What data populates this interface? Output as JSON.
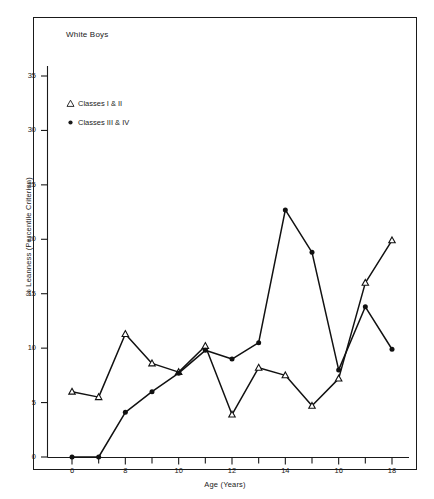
{
  "figure": {
    "title": "White Boys",
    "xlabel": "Age (Years)",
    "ylabel": "% Leanness (Percentile Criterion)"
  },
  "legend": [
    {
      "symbol": "open-triangle",
      "label": "Classes I & II"
    },
    {
      "symbol": "filled-circle",
      "label": "Classes III & IV"
    }
  ],
  "axis": {
    "y_ticks": [
      "0",
      "5",
      "10",
      "15",
      "20",
      "25",
      "30",
      "35"
    ],
    "x_ticks": [
      "6",
      "8",
      "10",
      "12",
      "14",
      "16",
      "18"
    ]
  },
  "chart_data": {
    "type": "line",
    "title": "White Boys",
    "xlabel": "Age (Years)",
    "ylabel": "% Leanness (Percentile Criterion)",
    "xlim": [
      5.4,
      18.7
    ],
    "ylim": [
      0,
      37.5
    ],
    "x_tick_values": [
      6,
      7,
      8,
      9,
      10,
      11,
      12,
      13,
      14,
      15,
      16,
      17,
      18
    ],
    "x_tick_labeled": [
      6,
      8,
      10,
      12,
      14,
      16,
      18
    ],
    "y_tick_values": [
      0,
      5,
      10,
      15,
      20,
      25,
      30,
      35
    ],
    "grid": false,
    "legend_position": "upper-left-inside",
    "x": [
      6,
      7,
      8,
      9,
      10,
      11,
      12,
      13,
      14,
      15,
      16,
      17,
      18
    ],
    "series": [
      {
        "name": "Classes I & II",
        "marker": "open-triangle",
        "x": [
          6,
          7,
          8,
          9,
          10,
          11,
          12,
          13,
          14,
          15,
          16,
          17,
          18
        ],
        "values": [
          6.0,
          5.5,
          11.3,
          8.6,
          7.8,
          10.2,
          3.9,
          8.2,
          7.5,
          4.7,
          7.2,
          16.0,
          19.9
        ]
      },
      {
        "name": "Classes III & IV",
        "marker": "filled-circle",
        "x": [
          6,
          7,
          8,
          9,
          10,
          11,
          12,
          13,
          14,
          15,
          16,
          17,
          18
        ],
        "values": [
          0.0,
          0.0,
          4.1,
          6.0,
          7.7,
          9.8,
          9.0,
          10.5,
          22.7,
          18.8,
          8.0,
          13.8,
          9.9
        ]
      }
    ]
  }
}
